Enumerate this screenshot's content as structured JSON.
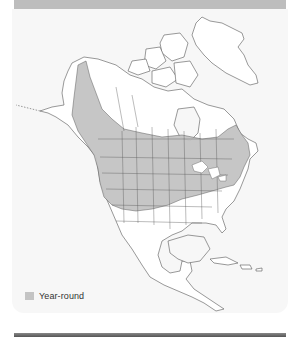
{
  "map": {
    "title": "Range map",
    "region": "North America",
    "colors": {
      "range_fill": "#c4c4c4",
      "land_fill": "#ffffff",
      "border_stroke": "#555555",
      "background": "#f7f7f7",
      "header_band": "#bdbdbd"
    },
    "legend": [
      {
        "label": "Year-round",
        "color": "#c4c4c4"
      }
    ]
  }
}
